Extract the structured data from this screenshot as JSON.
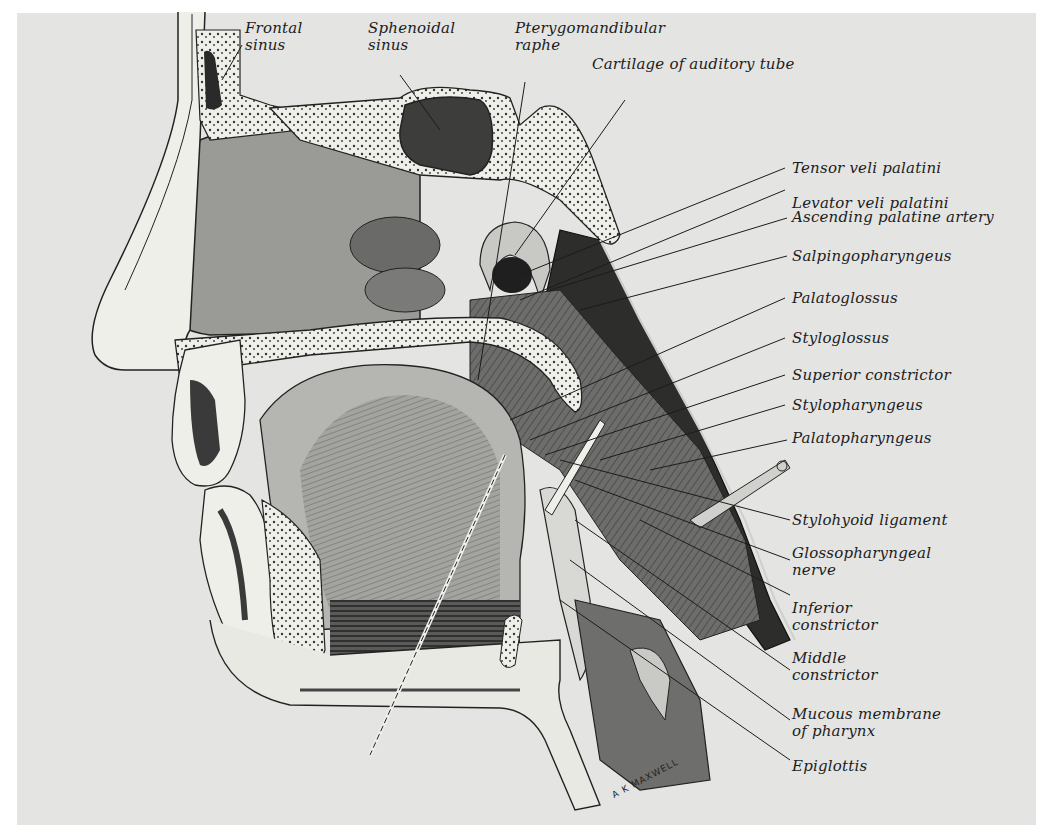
{
  "figure": {
    "artist_signature": "A K MAXWELL"
  },
  "labels": {
    "frontal_sinus": [
      "Frontal",
      "sinus"
    ],
    "sphenoidal_sinus": [
      "Sphenoidal",
      "sinus"
    ],
    "pterygomandibular_raphe": [
      "Pterygomandibular",
      "raphe"
    ],
    "cartilage_auditory_tube": "Cartilage of auditory tube",
    "tensor_veli_palatini": "Tensor veli palatini",
    "levator_veli_palatini": "Levator veli palatini",
    "ascending_palatine_artery": "Ascending palatine artery",
    "salpingopharyngeus": "Salpingopharyngeus",
    "palatoglossus": "Palatoglossus",
    "styloglossus": "Styloglossus",
    "superior_constrictor": "Superior constrictor",
    "stylopharyngeus": "Stylopharyngeus",
    "palatopharyngeus": "Palatopharyngeus",
    "stylohyoid_ligament": "Stylohyoid ligament",
    "glossopharyngeal_nerve": [
      "Glossopharyngeal",
      "nerve"
    ],
    "inferior_constrictor": [
      "Inferior",
      "constrictor"
    ],
    "middle_constrictor": [
      "Middle",
      "constrictor"
    ],
    "mucous_membrane_pharynx": [
      "Mucous membrane",
      "of pharynx"
    ],
    "epiglottis": "Epiglottis"
  },
  "colors": {
    "background": "#e4e4e2",
    "ink": "#1c1c1c",
    "bone": "#efefea",
    "tissue_dark": "#4a4a4a",
    "tissue_mid": "#8a8a88",
    "tissue_light": "#bdbdba"
  }
}
